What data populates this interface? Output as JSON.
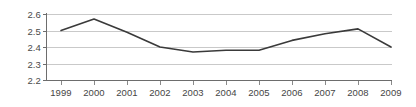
{
  "chart_data": {
    "type": "line",
    "title": "",
    "subtitle": "",
    "xlabel": "",
    "ylabel": "",
    "categories": [
      "1999",
      "2000",
      "2001",
      "2002",
      "2003",
      "2004",
      "2005",
      "2006",
      "2007",
      "2008",
      "2009"
    ],
    "values": [
      2.5,
      2.57,
      2.49,
      2.4,
      2.37,
      2.38,
      2.38,
      2.44,
      2.48,
      2.51,
      2.4
    ],
    "series": [
      {
        "name": "",
        "values": [
          2.5,
          2.57,
          2.49,
          2.4,
          2.37,
          2.38,
          2.38,
          2.44,
          2.48,
          2.51,
          2.4
        ]
      }
    ],
    "ylim": [
      2.2,
      2.6
    ],
    "yticks": [
      2.2,
      2.3,
      2.4,
      2.5,
      2.6
    ],
    "ytick_labels": [
      "2.2",
      "2.3",
      "2.4",
      "2.5",
      "2.6"
    ],
    "xlim": [
      "1999",
      "2009"
    ],
    "grid": true,
    "grid_axis": "y",
    "legend": false,
    "legend_position": "none",
    "markers": false,
    "colors": {
      "line": "#3a3a3a",
      "gridline": "#c9c9c9",
      "axis": "#6d6d6d",
      "tick_label": "#454545",
      "background": "#ffffff"
    }
  }
}
